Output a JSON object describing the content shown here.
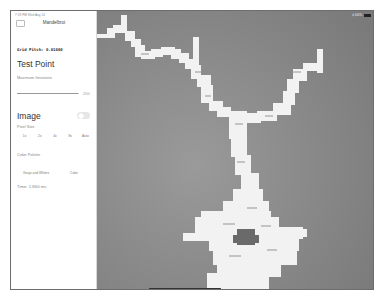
{
  "status_bar": {
    "time_date": "7:33 PM  Wed Aug 14",
    "right": "⚲ 100%"
  },
  "sidebar": {
    "title": "Mandelbrot",
    "grid_pitch": "Grid Pitch: 0.01000",
    "test_point_title": "Test Point",
    "max_iterations_label": "Maximum Iterations",
    "max_iterations_value": "200",
    "max_iterations_fraction": 0.98,
    "image_title": "Image",
    "image_toggle_on": false,
    "pixel_size_label": "Pixel Size",
    "pixel_size_options": [
      "1x",
      "2x",
      "4x",
      "8x",
      "Auto"
    ],
    "color_palette_label": "Color Palette",
    "color_palette_options": [
      "Grays and Whites",
      "Color"
    ],
    "time_text": "Time: 1,860 ms"
  },
  "canvas": {
    "background": "#8a8a8a",
    "fractal_color": "#f4f4f4",
    "description": "Mandelbrot fractal rendered in grayscale"
  },
  "colors": {
    "frame": "#6d6d6d",
    "sidebar_bg": "#ffffff",
    "toggle_off": "#e6e6e6"
  }
}
